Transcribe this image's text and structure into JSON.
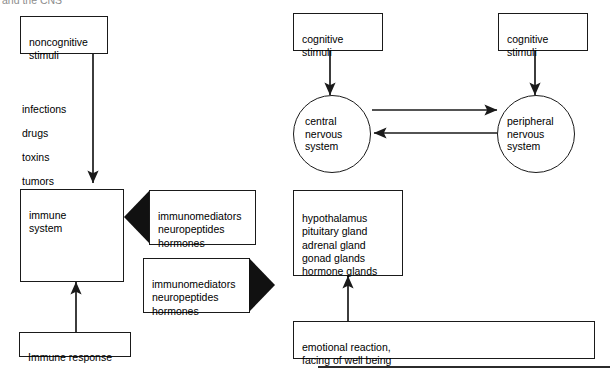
{
  "diagram": {
    "title_clipped": "and the CNS",
    "stimuli_list": "infections\ndrugs\ntoxins\ntumors",
    "nodes": {
      "noncognitive_stimuli": "noncognitive\nstimuli",
      "immune_system": "immune\nsystem",
      "immune_response": "Immune response",
      "cognitive_stimuli_left": "cognitive\nstimuli",
      "cognitive_stimuli_right": "cognitive\nstimuli",
      "central_nervous_system": "central\nnervous\nsystem",
      "peripheral_nervous_system": "peripheral\nnervous\nsystem",
      "endocrine_glands": "hypothalamus\npituitary gland\nadrenal gland\ngonad glands\nhormone glands",
      "emotional_reaction": "emotional reaction,\nfacing of well being"
    },
    "mediator_arrow_to_immune": "immunomediators\nneuropeptides\nhormones",
    "mediator_arrow_to_cns": "immunomediators\nneuropeptides\nhormones",
    "colors": {
      "stroke": "#1a1a1a",
      "fill": "#ffffff",
      "arrow_head": "#111111",
      "background": "#ffffff"
    }
  }
}
